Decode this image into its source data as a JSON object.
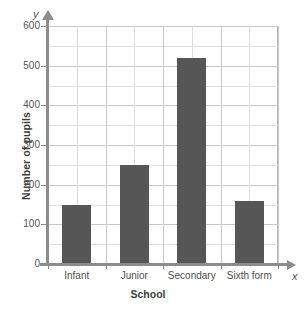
{
  "chart_data": {
    "type": "bar",
    "title": "",
    "xlabel": "School",
    "ylabel": "Number of pupils",
    "categories": [
      "Infant",
      "Junior",
      "Secondary",
      "Sixth form"
    ],
    "values": [
      150,
      250,
      520,
      158
    ],
    "ylim": [
      0,
      600
    ],
    "ytick_labels": [
      "0",
      "100",
      "200",
      "300",
      "400",
      "500",
      "600"
    ],
    "ytick_values": [
      0,
      100,
      200,
      300,
      400,
      500,
      600
    ],
    "minor_tick_step": 50,
    "grid": true,
    "legend": "none",
    "axis_letters": {
      "x": "x",
      "y": "y"
    },
    "bar_color": "#565656",
    "grid_color": "#c9c9c9",
    "minor_grid_color": "#dedede",
    "axis_color": "#8c8c8c"
  }
}
